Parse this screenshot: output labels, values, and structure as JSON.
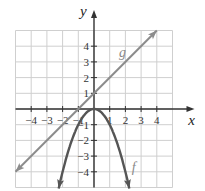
{
  "chart_data": {
    "type": "line",
    "title": "",
    "xlabel": "x",
    "ylabel": "y",
    "xlim": [
      -5,
      5
    ],
    "ylim": [
      -5,
      5
    ],
    "grid": true,
    "x_ticks": [
      "-4",
      "-3",
      "-2",
      "-1",
      "1",
      "2",
      "3",
      "4"
    ],
    "y_ticks": [
      "4",
      "3",
      "2",
      "1",
      "-1",
      "-2",
      "-3",
      "-4"
    ],
    "series": [
      {
        "name": "g",
        "description": "line y = x + 1",
        "color": "#8c8c8c",
        "points": [
          [
            -5,
            -4
          ],
          [
            -1,
            0
          ],
          [
            0,
            1
          ],
          [
            3,
            4
          ],
          [
            4,
            5
          ]
        ]
      },
      {
        "name": "f",
        "description": "parabola y = -x^2",
        "color": "#555555",
        "points": [
          [
            -2.2,
            -4.84
          ],
          [
            -2,
            -4
          ],
          [
            -1,
            -1
          ],
          [
            0,
            0
          ],
          [
            1,
            -1
          ],
          [
            2,
            -4
          ],
          [
            2.2,
            -4.84
          ]
        ]
      }
    ],
    "annotations": [
      {
        "text": "g",
        "x": 1.7,
        "y": 3.2
      },
      {
        "text": "f",
        "x": 2.4,
        "y": -3.9
      }
    ]
  }
}
